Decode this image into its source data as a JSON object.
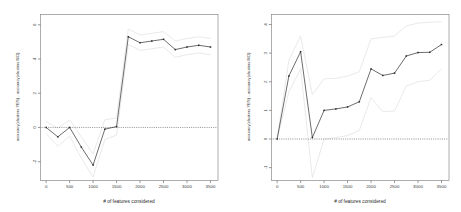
{
  "figure": {
    "background": "#ffffff",
    "series_color": "#333333",
    "band_color": "#e2e2e2",
    "zero_line_color": "#555555",
    "panel_count": 2
  },
  "chart_data": [
    {
      "type": "line",
      "panel": "left",
      "title": "",
      "xlabel": "# of features considered",
      "ylabel": "accuracy(clusters YES) - accuracy(clusters NO)",
      "xlim": [
        -120,
        3660
      ],
      "ylim": [
        -3.1,
        6.6
      ],
      "xticks": [
        0,
        500,
        1000,
        1500,
        2000,
        2500,
        3000,
        3500
      ],
      "yticks": [
        -2,
        0,
        2,
        4,
        6
      ],
      "grid": false,
      "legend": "none",
      "zero_reference_line": 0,
      "x": [
        0,
        250,
        500,
        750,
        1000,
        1250,
        1500,
        1750,
        2000,
        2250,
        2500,
        2750,
        3000,
        3250,
        3500
      ],
      "series": [
        {
          "name": "mean difference",
          "values": [
            0.0,
            -0.55,
            0.0,
            -1.15,
            -2.2,
            -0.1,
            0.05,
            5.3,
            4.95,
            5.05,
            5.15,
            4.55,
            4.7,
            4.8,
            4.7
          ]
        },
        {
          "name": "upper band",
          "values": [
            0.35,
            -0.05,
            0.45,
            -0.55,
            -1.55,
            0.45,
            0.55,
            5.75,
            5.4,
            5.5,
            5.6,
            5.05,
            5.2,
            5.3,
            5.2
          ]
        },
        {
          "name": "lower band",
          "values": [
            -0.35,
            -1.1,
            -0.5,
            -1.8,
            -2.9,
            -0.7,
            -0.45,
            4.85,
            4.5,
            4.6,
            4.7,
            4.1,
            4.25,
            4.35,
            4.25
          ]
        }
      ]
    },
    {
      "type": "line",
      "panel": "right",
      "title": "",
      "xlabel": "# of features considered",
      "ylabel": "accuracy(clusters YES) - accuracy(clusters NO)",
      "xlim": [
        -120,
        3660
      ],
      "ylim": [
        -1.45,
        4.35
      ],
      "xticks": [
        0,
        500,
        1000,
        1500,
        2000,
        2500,
        3000,
        3500
      ],
      "yticks": [
        -1,
        0,
        1,
        2,
        3,
        4
      ],
      "grid": false,
      "legend": "none",
      "zero_reference_line": 0,
      "x": [
        0,
        250,
        500,
        750,
        1000,
        1250,
        1500,
        1750,
        2000,
        2250,
        2500,
        2750,
        3000,
        3250,
        3500
      ],
      "series": [
        {
          "name": "mean difference",
          "values": [
            0.0,
            2.2,
            3.05,
            0.05,
            1.0,
            1.05,
            1.12,
            1.3,
            2.45,
            2.22,
            2.3,
            2.9,
            3.02,
            3.03,
            3.3
          ]
        },
        {
          "name": "upper band",
          "values": [
            0.0,
            2.75,
            3.6,
            1.55,
            2.1,
            2.12,
            2.2,
            2.35,
            3.5,
            3.55,
            3.6,
            3.95,
            4.05,
            4.08,
            4.1
          ]
        },
        {
          "name": "lower band",
          "values": [
            0.0,
            1.65,
            2.45,
            -1.35,
            0.0,
            0.05,
            0.12,
            0.3,
            1.45,
            0.95,
            0.98,
            1.85,
            2.0,
            2.05,
            2.45
          ]
        }
      ]
    }
  ]
}
